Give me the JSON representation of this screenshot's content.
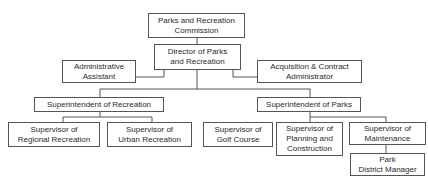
{
  "chart": {
    "nodes": {
      "commission": "Parks and Recreation\nCommission",
      "director": "Director of Parks\nand Recreation",
      "admin_assistant": "Administrative\nAssistant",
      "acquisition_admin": "Acquisition & Contract\nAdministrator",
      "supt_recreation": "Superintendent of Recreation",
      "supt_parks": "Superintendent of Parks",
      "sup_regional": "Supervisor of\nRegional Recreation",
      "sup_urban": "Supervisor of\nUrban Recreation",
      "sup_golf": "Supervisor of\nGolf Course",
      "sup_planning": "Supervisor of\nPlanning and\nConstruction",
      "sup_maintenance": "Supervisor of\nMaintenance",
      "park_district_mgr": "Park\nDistrict Manager"
    }
  }
}
